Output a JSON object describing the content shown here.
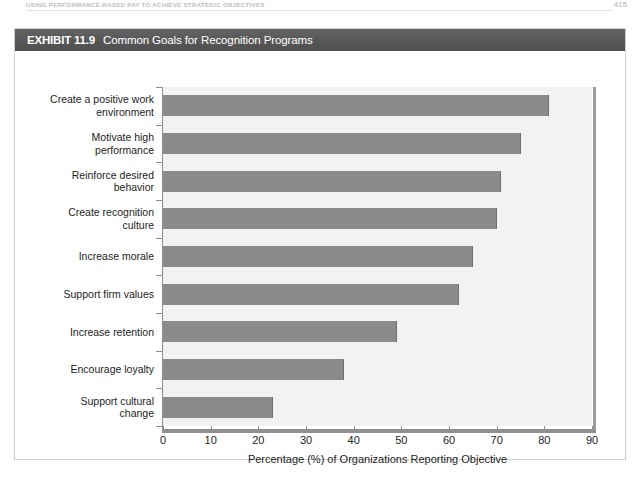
{
  "page": {
    "running_head": "USING PERFORMANCE-BASED PAY TO ACHIEVE STRATEGIC OBJECTIVES",
    "page_number": "415"
  },
  "exhibit": {
    "label": "EXHIBIT 11.9",
    "title": "Common Goals for Recognition Programs"
  },
  "chart_data": {
    "type": "bar",
    "orientation": "horizontal",
    "title": "Common Goals for Recognition Programs",
    "categories": [
      "Create a positive work environment",
      "Motivate high performance",
      "Reinforce desired behavior",
      "Create recognition culture",
      "Increase morale",
      "Support firm values",
      "Increase retention",
      "Encourage loyalty",
      "Support cultural change"
    ],
    "category_lines": [
      [
        "Create a positive work",
        "environment"
      ],
      [
        "Motivate high",
        "performance"
      ],
      [
        "Reinforce desired",
        "behavior"
      ],
      [
        "Create recognition",
        "culture"
      ],
      [
        "Increase morale"
      ],
      [
        "Support firm values"
      ],
      [
        "Increase retention"
      ],
      [
        "Encourage loyalty"
      ],
      [
        "Support cultural",
        "change"
      ]
    ],
    "values": [
      81,
      75,
      71,
      70,
      65,
      62,
      49,
      38,
      23
    ],
    "xlabel": "Percentage (%) of Organizations Reporting Objective",
    "ylabel": "",
    "xlim": [
      0,
      90
    ],
    "xticks": [
      0,
      10,
      20,
      30,
      40,
      50,
      60,
      70,
      80,
      90
    ],
    "xtick_labels": [
      "0",
      "10",
      "20",
      "30",
      "40",
      "50",
      "60",
      "70",
      "80",
      "90"
    ],
    "grid": false,
    "legend": null,
    "bar_color": "#8b8b8b",
    "plot_background": "#f2f2f2",
    "axis_color": "#8f8f8f"
  },
  "theme": {
    "titlebar_background": "#585858",
    "titlebar_text": "#ffffff",
    "frame_border": "#cfcfcf",
    "page_background": "#ffffff"
  }
}
